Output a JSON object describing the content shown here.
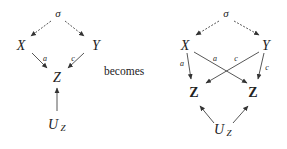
{
  "connector": {
    "label": "becomes"
  },
  "left_diagram": {
    "nodes": {
      "sigma": "σ",
      "x": "X",
      "y": "Y",
      "z": "Z",
      "uz_main": "U",
      "uz_sub": "Z"
    },
    "edge_labels": {
      "x_to_z": "a",
      "y_to_z": "c"
    }
  },
  "right_diagram": {
    "nodes": {
      "sigma": "σ",
      "x": "X",
      "y": "Y",
      "z_left": "Z",
      "z_right": "Z",
      "uz_main": "U",
      "uz_sub": "Z"
    },
    "edge_labels": {
      "x_to_z_left": "a",
      "x_to_z_right": "a",
      "y_to_z_left": "c",
      "y_to_z_right": "c"
    }
  },
  "colors": {
    "ink": "#222222",
    "background": "#ffffff"
  }
}
